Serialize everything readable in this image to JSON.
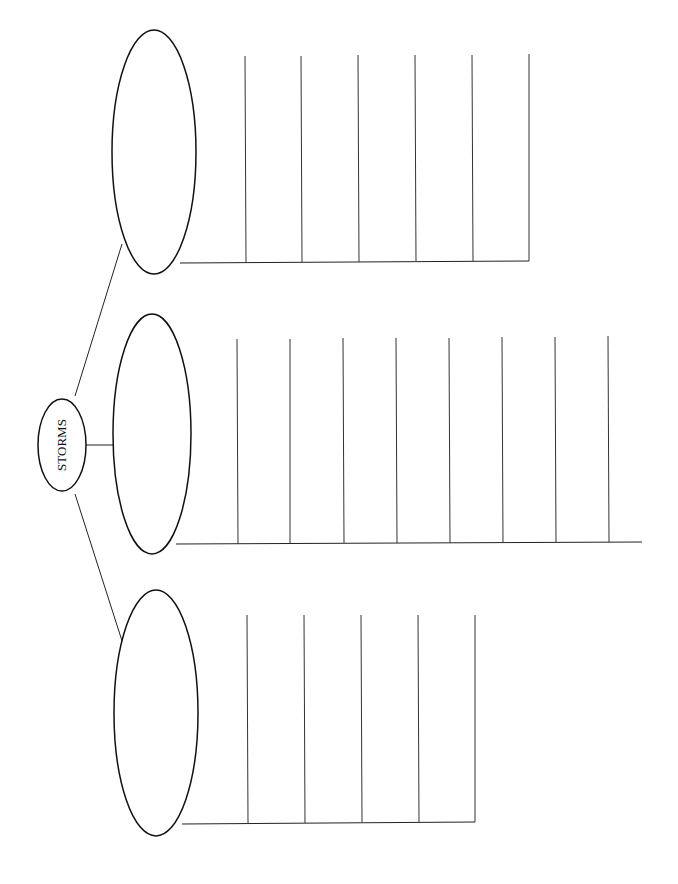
{
  "diagram": {
    "title": "STORMS",
    "type": "graphic organizer (blank tree map)",
    "center_node": {
      "label": "STORMS"
    },
    "branches": [
      {
        "id": "top",
        "label": "",
        "lines": 6
      },
      {
        "id": "middle",
        "label": "",
        "lines": 8
      },
      {
        "id": "bottom",
        "label": "",
        "lines": 5
      }
    ],
    "colors": {
      "stroke": "#111111",
      "background": "#ffffff"
    }
  }
}
